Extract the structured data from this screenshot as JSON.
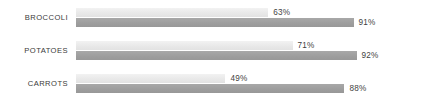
{
  "chart_data": {
    "type": "bar",
    "orientation": "horizontal",
    "title": "",
    "subtitle": "",
    "xlabel": "",
    "ylabel": "",
    "xlim": [
      0,
      100
    ],
    "grid": false,
    "legend": "none",
    "units": "%",
    "categories": [
      "BROCCOLI",
      "POTATOES",
      "CARROTS"
    ],
    "series": [
      {
        "name": "series-light",
        "color": "#e8e8e8",
        "values": [
          63,
          71,
          49
        ],
        "labels": [
          "63%",
          "71%",
          "49%"
        ]
      },
      {
        "name": "series-dark",
        "color": "#9d9d9d",
        "values": [
          91,
          92,
          88
        ],
        "labels": [
          "91%",
          "92%",
          "88%"
        ]
      }
    ]
  },
  "groups": [
    {
      "category": "BROCCOLI",
      "light": {
        "value": 63,
        "label": "63%"
      },
      "dark": {
        "value": 91,
        "label": "91%"
      }
    },
    {
      "category": "POTATOES",
      "light": {
        "value": 71,
        "label": "71%"
      },
      "dark": {
        "value": 92,
        "label": "92%"
      }
    },
    {
      "category": "CARROTS",
      "light": {
        "value": 49,
        "label": "49%"
      },
      "dark": {
        "value": 88,
        "label": "88%"
      }
    }
  ],
  "colors": {
    "light_bar": "#e8e8e8",
    "dark_bar": "#9d9d9d",
    "label_text": "#3a3a3a",
    "value_text": "#3f3f3f",
    "background": "#ffffff"
  }
}
